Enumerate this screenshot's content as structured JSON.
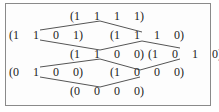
{
  "diagram": {
    "type": "lattice",
    "nodes": [
      {
        "id": "n1111",
        "label": "(1  1  1  1)",
        "x": 70,
        "y": 10
      },
      {
        "id": "n1101",
        "label": "(1  1  0  1)",
        "x": 9,
        "y": 29
      },
      {
        "id": "n1110",
        "label": "(1  1  1  0)",
        "x": 110,
        "y": 29
      },
      {
        "id": "n1100",
        "label": "(1  1  0  0)",
        "x": 70,
        "y": 48
      },
      {
        "id": "n1010",
        "label": "(1  0  1  0)",
        "x": 148,
        "y": 48
      },
      {
        "id": "n0100",
        "label": "(0  1  0  0)",
        "x": 9,
        "y": 66
      },
      {
        "id": "n1000",
        "label": "(1  0  0  0)",
        "x": 110,
        "y": 66
      },
      {
        "id": "n0000",
        "label": "(0  0  0  0)",
        "x": 70,
        "y": 85
      }
    ],
    "edges": [
      {
        "from": "n1101",
        "to": "n1111"
      },
      {
        "from": "n1111",
        "to": "n1110"
      },
      {
        "from": "n1101",
        "to": "n1100"
      },
      {
        "from": "n1100",
        "to": "n1110"
      },
      {
        "from": "n1110",
        "to": "n1010"
      },
      {
        "from": "n0100",
        "to": "n1100"
      },
      {
        "from": "n1100",
        "to": "n1000"
      },
      {
        "from": "n1000",
        "to": "n1010"
      },
      {
        "from": "n0100",
        "to": "n0000"
      },
      {
        "from": "n0000",
        "to": "n1000"
      }
    ],
    "colors": {
      "text": "#222222",
      "line": "#555555",
      "border": "#8a8a8a"
    }
  }
}
